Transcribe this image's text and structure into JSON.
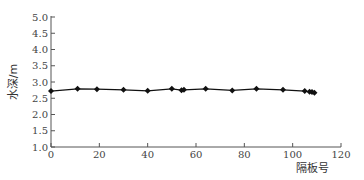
{
  "chart_data": {
    "type": "line",
    "title": "",
    "xlabel": "隔板号",
    "ylabel": "水深/m",
    "xlim": [
      0,
      120
    ],
    "ylim": [
      1.0,
      5.0
    ],
    "x_ticks": [
      "0",
      "20",
      "40",
      "60",
      "80",
      "100",
      "120"
    ],
    "y_ticks": [
      "1.0",
      "1.5",
      "2.0",
      "2.5",
      "3.0",
      "3.5",
      "4.0",
      "4.5",
      "5.0"
    ],
    "grid": false,
    "legend": null,
    "series": [
      {
        "name": "水深",
        "marker": "diamond",
        "color": "#111111",
        "x": [
          0,
          11,
          19,
          30,
          40,
          50,
          54,
          55,
          64,
          75,
          85,
          96,
          105,
          107,
          108,
          109
        ],
        "y": [
          2.72,
          2.79,
          2.78,
          2.76,
          2.73,
          2.79,
          2.75,
          2.76,
          2.79,
          2.74,
          2.79,
          2.76,
          2.72,
          2.7,
          2.69,
          2.67
        ]
      }
    ]
  }
}
